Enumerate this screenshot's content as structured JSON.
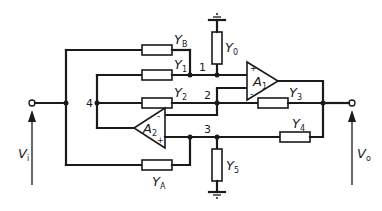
{
  "diagram": {
    "type": "circuit-schematic",
    "labels": {
      "input_voltage": "V",
      "input_voltage_sub": "i",
      "output_voltage": "V",
      "output_voltage_sub": "o"
    },
    "admittances": [
      {
        "id": "YB",
        "symbol": "Y",
        "sub": "B"
      },
      {
        "id": "Y1",
        "symbol": "Y",
        "sub": "1"
      },
      {
        "id": "Y2",
        "symbol": "Y",
        "sub": "2"
      },
      {
        "id": "Y0",
        "symbol": "Y",
        "sub": "0"
      },
      {
        "id": "Y3",
        "symbol": "Y",
        "sub": "3"
      },
      {
        "id": "Y4",
        "symbol": "Y",
        "sub": "4"
      },
      {
        "id": "Y5",
        "symbol": "Y",
        "sub": "5"
      },
      {
        "id": "YA",
        "symbol": "Y",
        "sub": "A"
      }
    ],
    "amplifiers": [
      {
        "id": "A1",
        "symbol": "A",
        "sub": "1",
        "plus": "+",
        "minus": "-"
      },
      {
        "id": "A2",
        "symbol": "A",
        "sub": "2",
        "plus": "+",
        "minus": "-"
      }
    ],
    "nodes": [
      "1",
      "2",
      "3",
      "4"
    ]
  }
}
